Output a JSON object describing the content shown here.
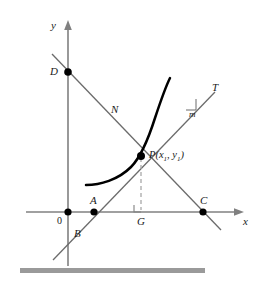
{
  "figure": {
    "axes": {
      "x_label": "x",
      "y_label": "y",
      "origin_label": "0"
    },
    "points": [
      {
        "id": "origin",
        "label": "0",
        "x": 68,
        "y": 212,
        "dot": true,
        "label_dx": -10,
        "label_dy": 6
      },
      {
        "id": "A",
        "label": "A",
        "x": 94,
        "y": 212,
        "dot": true,
        "label_dx": -3,
        "label_dy": -18
      },
      {
        "id": "C",
        "label": "C",
        "x": 203,
        "y": 212,
        "dot": true,
        "label_dx": -2,
        "label_dy": -18
      },
      {
        "id": "D",
        "label": "D",
        "x": 68,
        "y": 72,
        "dot": true,
        "label_dx": -16,
        "label_dy": -4
      },
      {
        "id": "P",
        "label": "P",
        "x": 141,
        "y": 156,
        "dot": true,
        "label_dx": 7,
        "label_dy": 4
      },
      {
        "id": "G",
        "label": "G",
        "x": 141,
        "y": 212,
        "dot": false,
        "label_dx": -4,
        "label_dy": 8
      },
      {
        "id": "B",
        "label": "B",
        "x": 76,
        "y": 232,
        "dot": false,
        "label_dx": 0,
        "label_dy": 0
      }
    ],
    "line_labels": [
      {
        "id": "tangent",
        "label": "T",
        "x": 214,
        "y": 88
      },
      {
        "id": "normal",
        "label": "N",
        "x": 114,
        "y": 110
      },
      {
        "id": "slope",
        "label": "m",
        "x": 192,
        "y": 113
      }
    ],
    "point_p": {
      "name": "P",
      "open_paren": "(",
      "x_var": "x",
      "x_sub": "1",
      "comma": ", ",
      "y_var": "y",
      "y_sub": "1",
      "close_paren": ")",
      "full_text": "P(x1, y1)"
    },
    "colors": {
      "curve": "#000000",
      "tangent": "#6b6b6b",
      "normal": "#6b6b6b",
      "axis": "#808080",
      "dot": "#000000",
      "dashed": "#a8a8a8",
      "bottom_bar": "#9a9a9a",
      "label": "#1a1a1a"
    },
    "bottom_bar": {
      "present": true,
      "x": 20,
      "y": 268,
      "width": 185,
      "height": 5
    },
    "right_angle_marker": {
      "at_point": "G",
      "size": 7
    },
    "dashed_segment": {
      "from": "P",
      "to": "G"
    }
  }
}
